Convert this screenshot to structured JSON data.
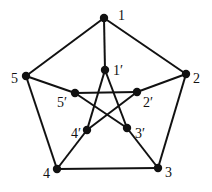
{
  "diagram": {
    "type": "graph",
    "name": "Petersen graph",
    "stroke_color": "#111111",
    "node_color": "#111111",
    "nodes": [
      {
        "id": "1",
        "label": "1",
        "x": 104,
        "y": 18,
        "lx": 118,
        "ly": 20
      },
      {
        "id": "2",
        "label": "2",
        "x": 186,
        "y": 74,
        "lx": 193,
        "ly": 83
      },
      {
        "id": "3",
        "label": "3",
        "x": 158,
        "y": 168,
        "lx": 165,
        "ly": 177
      },
      {
        "id": "4",
        "label": "4",
        "x": 57,
        "y": 169,
        "lx": 43,
        "ly": 178
      },
      {
        "id": "5",
        "label": "5",
        "x": 26,
        "y": 76,
        "lx": 11,
        "ly": 83
      },
      {
        "id": "1p",
        "label": "1′",
        "x": 105,
        "y": 70,
        "lx": 113,
        "ly": 75
      },
      {
        "id": "2p",
        "label": "2′",
        "x": 137,
        "y": 92,
        "lx": 143,
        "ly": 107
      },
      {
        "id": "3p",
        "label": "3′",
        "x": 127,
        "y": 128,
        "lx": 135,
        "ly": 138
      },
      {
        "id": "4p",
        "label": "4′",
        "x": 87,
        "y": 130,
        "lx": 71,
        "ly": 138
      },
      {
        "id": "5p",
        "label": "5′",
        "x": 75,
        "y": 93,
        "lx": 57,
        "ly": 107
      }
    ],
    "edges": [
      [
        "1",
        "2"
      ],
      [
        "2",
        "3"
      ],
      [
        "3",
        "4"
      ],
      [
        "4",
        "5"
      ],
      [
        "5",
        "1"
      ],
      [
        "1",
        "1p"
      ],
      [
        "2",
        "2p"
      ],
      [
        "3",
        "3p"
      ],
      [
        "4",
        "4p"
      ],
      [
        "5",
        "5p"
      ],
      [
        "1p",
        "3p"
      ],
      [
        "1p",
        "4p"
      ],
      [
        "2p",
        "4p"
      ],
      [
        "2p",
        "5p"
      ],
      [
        "3p",
        "5p"
      ]
    ]
  }
}
